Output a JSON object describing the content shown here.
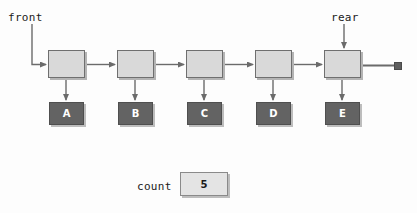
{
  "diagram": {
    "pointers": {
      "front_label": "front",
      "rear_label": "rear"
    },
    "nodes": [
      {
        "data": "A"
      },
      {
        "data": "B"
      },
      {
        "data": "C"
      },
      {
        "data": "D"
      },
      {
        "data": "E"
      }
    ],
    "terminator": {
      "name": "null-pointer",
      "symbol": ""
    },
    "count": {
      "label": "count",
      "value": "5"
    },
    "colors": {
      "node_fill": "#d9d9d9",
      "node_border": "#6f6f6f",
      "data_fill": "#636363",
      "data_text": "#ffffff",
      "count_fill": "#e4e4e4",
      "line": "#6b6b6b",
      "shadow": "#bdbdbd",
      "text": "#1a1a1a"
    }
  }
}
